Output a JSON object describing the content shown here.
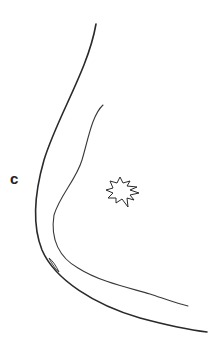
{
  "figure": {
    "panel_label": "c",
    "elements": [
      {
        "name": "outer-contour",
        "kind": "curve"
      },
      {
        "name": "inner-contour",
        "kind": "curve"
      },
      {
        "name": "starburst-marker",
        "kind": "starburst"
      },
      {
        "name": "small-loop",
        "kind": "loop"
      }
    ],
    "colors": {
      "stroke": "#2a2a2a",
      "background": "#ffffff"
    }
  }
}
